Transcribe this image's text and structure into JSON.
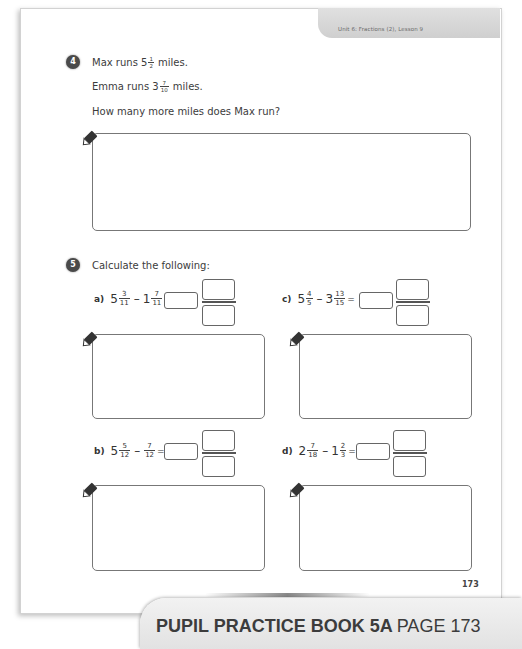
{
  "header": {
    "unit_lesson": "Unit 6: Fractions (2), Lesson 9"
  },
  "question4": {
    "number": "4",
    "line1": {
      "prefix": "Max runs 5",
      "frac_num": "1",
      "frac_den": "2",
      "suffix": " miles."
    },
    "line2": {
      "prefix": "Emma runs 3",
      "frac_num": "7",
      "frac_den": "10",
      "suffix": " miles."
    },
    "line3": "How many more miles does Max run?"
  },
  "question5": {
    "number": "5",
    "prompt": "Calculate the following:",
    "parts": [
      {
        "label": "a)",
        "w1": "5",
        "n1": "3",
        "d1": "11",
        "op": "–",
        "w2": "1",
        "n2": "7",
        "d2": "11",
        "eq": "="
      },
      {
        "label": "c)",
        "w1": "5",
        "n1": "4",
        "d1": "5",
        "op": "–",
        "w2": "3",
        "n2": "13",
        "d2": "15",
        "eq": "="
      },
      {
        "label": "b)",
        "w1": "5",
        "n1": "5",
        "d1": "12",
        "op": "–",
        "w2": "",
        "n2": "7",
        "d2": "12",
        "eq": "="
      },
      {
        "label": "d)",
        "w1": "2",
        "n1": "7",
        "d1": "18",
        "op": "–",
        "w2": "1",
        "n2": "2",
        "d2": "3",
        "eq": "="
      }
    ]
  },
  "footer": {
    "page_number": "173",
    "banner_bold": "PUPIL PRACTICE BOOK 5A",
    "banner_page": "PAGE 173"
  }
}
